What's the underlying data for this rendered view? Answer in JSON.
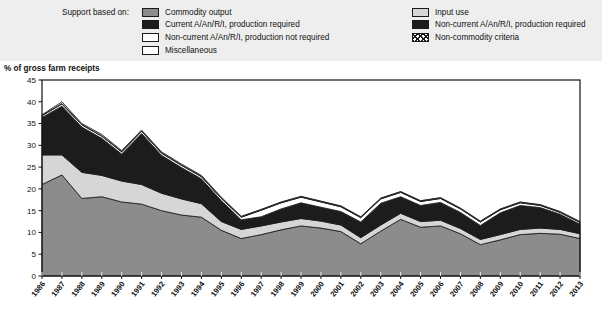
{
  "legend": {
    "title": "Support based on:",
    "left_items": [
      {
        "label": "Commodity output",
        "swatch": "commodity-output-swatch",
        "color": "#8c8c8c"
      },
      {
        "label": "Current A/An/R/I, production required",
        "swatch": "current-production-required-swatch",
        "color": "#1c1c1c"
      },
      {
        "label": "Non-current A/An/R/I, production not required",
        "swatch": "noncurrent-production-not-required-swatch",
        "color": "#ffffff"
      },
      {
        "label": "Miscellaneous",
        "swatch": "miscellaneous-swatch",
        "color": "#ffffff"
      }
    ],
    "right_items": [
      {
        "label": "Input use",
        "swatch": "input-use-swatch",
        "color": "#d6d6d6"
      },
      {
        "label": "Non-current A/An/R/I, production required",
        "swatch": "noncurrent-production-required-swatch",
        "color": "#1c1c1c"
      },
      {
        "label": "Non-commodity criteria",
        "swatch": "non-commodity-criteria-swatch",
        "color": "#ffffff"
      }
    ]
  },
  "chart_data": {
    "type": "area",
    "stacked": true,
    "title": "",
    "ylabel": "% of gross farm receipts",
    "xlabel": "",
    "ylim": [
      0,
      45
    ],
    "yticks": [
      0,
      5,
      10,
      15,
      20,
      25,
      30,
      35,
      40,
      45
    ],
    "grid": false,
    "legend_position": "top",
    "categories": [
      "1986",
      "1987",
      "1988",
      "1989",
      "1990",
      "1991",
      "1992",
      "1993",
      "1994",
      "1995",
      "1996",
      "1997",
      "1998",
      "1999",
      "2000",
      "2001",
      "2002",
      "2003",
      "2004",
      "2005",
      "2006",
      "2007",
      "2008",
      "2009",
      "2010",
      "2011",
      "2012",
      "2013"
    ],
    "series": [
      {
        "name": "Commodity output",
        "color": "#8c8c8c",
        "values": [
          21.0,
          23.2,
          17.8,
          18.2,
          17.0,
          16.5,
          15.0,
          14.0,
          13.5,
          10.5,
          8.6,
          9.5,
          10.6,
          11.5,
          11.0,
          10.2,
          7.4,
          10.3,
          13.0,
          11.2,
          11.5,
          9.7,
          7.2,
          8.3,
          9.5,
          9.8,
          9.6,
          8.6
        ]
      },
      {
        "name": "Input use",
        "color": "#d6d6d6",
        "values": [
          6.8,
          4.6,
          6.0,
          4.9,
          4.8,
          4.5,
          4.0,
          3.7,
          3.1,
          2.0,
          2.1,
          2.0,
          1.8,
          1.7,
          1.6,
          1.5,
          1.4,
          1.4,
          1.4,
          1.3,
          1.3,
          1.2,
          1.2,
          1.2,
          1.2,
          1.2,
          1.1,
          1.1
        ]
      },
      {
        "name": "Current A/An/R/I, production required",
        "color": "#1c1c1c",
        "values": [
          8.4,
          11.0,
          10.2,
          8.3,
          6.0,
          11.5,
          8.5,
          7.0,
          5.5,
          4.6,
          2.0,
          1.9,
          2.8,
          3.4,
          3.0,
          2.9,
          3.4,
          4.8,
          3.6,
          3.5,
          3.9,
          3.5,
          3.0,
          4.8,
          5.3,
          4.5,
          3.3,
          2.0
        ]
      },
      {
        "name": "Non-current A/An/R/I, production required",
        "color": "#1c1c1c",
        "values": [
          0.2,
          0.2,
          0.2,
          0.2,
          0.2,
          0.2,
          0.2,
          0.2,
          0.2,
          0.2,
          0.2,
          0.2,
          0.2,
          0.2,
          0.2,
          0.2,
          0.2,
          0.2,
          0.2,
          0.2,
          0.2,
          0.2,
          0.2,
          0.2,
          0.2,
          0.2,
          0.2,
          0.2
        ]
      },
      {
        "name": "Non-current A/An/R/I, production not required",
        "color": "#ffffff",
        "values": [
          0.4,
          0.5,
          0.5,
          0.5,
          0.5,
          0.5,
          0.5,
          0.5,
          0.5,
          0.5,
          0.6,
          1.5,
          1.4,
          1.3,
          1.2,
          1.1,
          1.0,
          1.0,
          1.0,
          0.9,
          0.9,
          0.8,
          0.8,
          0.7,
          0.6,
          0.5,
          0.4,
          0.4
        ]
      },
      {
        "name": "Non-commodity criteria",
        "color": "#ffffff",
        "values": [
          0.1,
          0.1,
          0.1,
          0.1,
          0.1,
          0.1,
          0.1,
          0.1,
          0.1,
          0.1,
          0.1,
          0.1,
          0.1,
          0.1,
          0.1,
          0.1,
          0.1,
          0.1,
          0.1,
          0.1,
          0.1,
          0.1,
          0.1,
          0.1,
          0.1,
          0.1,
          0.1,
          0.1
        ]
      },
      {
        "name": "Miscellaneous",
        "color": "#ffffff",
        "values": [
          0.1,
          0.4,
          0.2,
          0.3,
          0.2,
          0.2,
          0.2,
          0.2,
          0.2,
          0.2,
          0.1,
          0.1,
          0.1,
          0.1,
          0.1,
          0.1,
          0.1,
          0.1,
          0.1,
          0.1,
          0.1,
          0.1,
          0.1,
          0.1,
          0.1,
          0.1,
          0.1,
          0.1
        ]
      }
    ],
    "totals": [
      37.0,
      39.9,
      35.0,
      32.5,
      28.8,
      33.5,
      28.5,
      25.6,
      23.1,
      18.1,
      13.7,
      15.3,
      17.0,
      18.3,
      17.2,
      16.1,
      13.6,
      17.9,
      19.4,
      17.3,
      18.0,
      15.6,
      12.6,
      15.4,
      17.0,
      16.4,
      14.8,
      12.5
    ]
  }
}
